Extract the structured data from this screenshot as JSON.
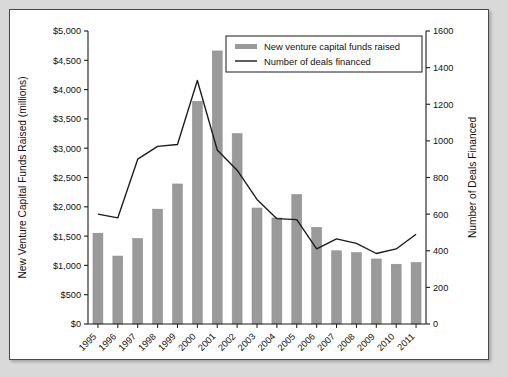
{
  "chart_data": {
    "type": "bar",
    "title": "",
    "subtitle": "",
    "xlabel": "",
    "ylabel": "New Venture Capital Funds Raised (millions)",
    "y2label": "Number of Deals Financed",
    "categories": [
      "1995",
      "1996",
      "1997",
      "1998",
      "1999",
      "2000",
      "2001",
      "2002",
      "2003",
      "2004",
      "2005",
      "2006",
      "2007",
      "2008",
      "2009",
      "2010",
      "2011"
    ],
    "ylim": [
      0,
      5000
    ],
    "y2lim": [
      0,
      1600
    ],
    "ytick_step": 500,
    "y2tick_step": 200,
    "ytick_labels": [
      "$0",
      "$500",
      "$1,000",
      "$1,500",
      "$2,000",
      "$2,500",
      "$3,000",
      "$3,500",
      "$4,000",
      "$4,500",
      "$5,000"
    ],
    "y2tick_labels": [
      "0",
      "200",
      "400",
      "600",
      "800",
      "1000",
      "1200",
      "1400",
      "1600"
    ],
    "grid": false,
    "legend_position": "top-right",
    "series": [
      {
        "name": "New venture capital funds raised",
        "render": "bar",
        "axis": "left",
        "units": "millions of dollars",
        "color": "#9a9a9a",
        "values": [
          1550,
          1160,
          1460,
          1960,
          2390,
          3800,
          4660,
          3250,
          1980,
          1810,
          2210,
          1650,
          1250,
          1220,
          1110,
          1020,
          1050
        ]
      },
      {
        "name": "Number of deals financed",
        "render": "line",
        "axis": "right",
        "units": "deals",
        "color": "#1a1a1a",
        "values": [
          600,
          580,
          900,
          970,
          980,
          1330,
          950,
          840,
          680,
          575,
          570,
          410,
          465,
          440,
          385,
          410,
          490
        ]
      }
    ]
  },
  "legend": {
    "items": [
      {
        "label": "New venture capital funds raised",
        "marker": "bar-swatch"
      },
      {
        "label": "Number of deals financed",
        "marker": "line-swatch"
      }
    ]
  },
  "colors": {
    "bar": "#9a9a9a",
    "line": "#1a1a1a",
    "page_background": "#d9d9d9",
    "card_background": "#ffffff",
    "axis": "#1a1a1a"
  }
}
